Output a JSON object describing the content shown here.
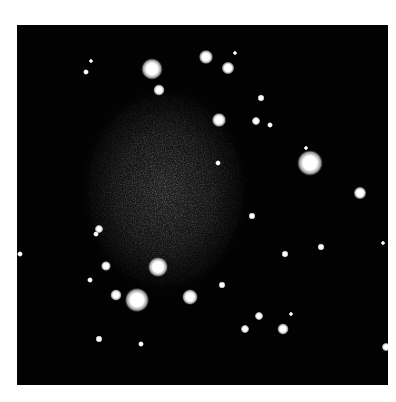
{
  "image": {
    "subject": "dwarf galaxy star field",
    "frame": {
      "x": 17,
      "y": 25,
      "width": 371,
      "height": 360
    },
    "background_color": "#020202",
    "page_background": "#ffffff"
  },
  "galaxy": {
    "cx": 165,
    "cy": 190,
    "rx": 88,
    "ry": 108,
    "core_color": "#5a5a5a",
    "edge_color": "#020202"
  },
  "stars": [
    {
      "x": 152,
      "y": 69,
      "r": 7.5
    },
    {
      "x": 206,
      "y": 57,
      "r": 5
    },
    {
      "x": 228,
      "y": 68,
      "r": 4.5
    },
    {
      "x": 159,
      "y": 90,
      "r": 4
    },
    {
      "x": 235,
      "y": 53,
      "r": 1.5
    },
    {
      "x": 91,
      "y": 61,
      "r": 1.5
    },
    {
      "x": 86,
      "y": 72,
      "r": 2
    },
    {
      "x": 219,
      "y": 120,
      "r": 5
    },
    {
      "x": 261,
      "y": 98,
      "r": 2.5
    },
    {
      "x": 256,
      "y": 121,
      "r": 3
    },
    {
      "x": 270,
      "y": 125,
      "r": 2
    },
    {
      "x": 306,
      "y": 148,
      "r": 1.5
    },
    {
      "x": 310,
      "y": 163,
      "r": 9
    },
    {
      "x": 360,
      "y": 193,
      "r": 4.5
    },
    {
      "x": 218,
      "y": 163,
      "r": 2
    },
    {
      "x": 252,
      "y": 216,
      "r": 2.5
    },
    {
      "x": 321,
      "y": 247,
      "r": 2.5
    },
    {
      "x": 285,
      "y": 254,
      "r": 2.5
    },
    {
      "x": 383,
      "y": 243,
      "r": 1.5
    },
    {
      "x": 20,
      "y": 254,
      "r": 2
    },
    {
      "x": 99,
      "y": 229,
      "r": 3
    },
    {
      "x": 96,
      "y": 234,
      "r": 2
    },
    {
      "x": 158,
      "y": 267,
      "r": 7
    },
    {
      "x": 106,
      "y": 266,
      "r": 3.5
    },
    {
      "x": 90,
      "y": 280,
      "r": 2
    },
    {
      "x": 222,
      "y": 285,
      "r": 2.5
    },
    {
      "x": 116,
      "y": 295,
      "r": 4
    },
    {
      "x": 137,
      "y": 300,
      "r": 8.5
    },
    {
      "x": 190,
      "y": 297,
      "r": 5.5
    },
    {
      "x": 259,
      "y": 316,
      "r": 3
    },
    {
      "x": 291,
      "y": 314,
      "r": 1.5
    },
    {
      "x": 245,
      "y": 329,
      "r": 3
    },
    {
      "x": 283,
      "y": 329,
      "r": 4
    },
    {
      "x": 99,
      "y": 339,
      "r": 2.5
    },
    {
      "x": 141,
      "y": 344,
      "r": 2
    },
    {
      "x": 386,
      "y": 347,
      "r": 3
    }
  ]
}
